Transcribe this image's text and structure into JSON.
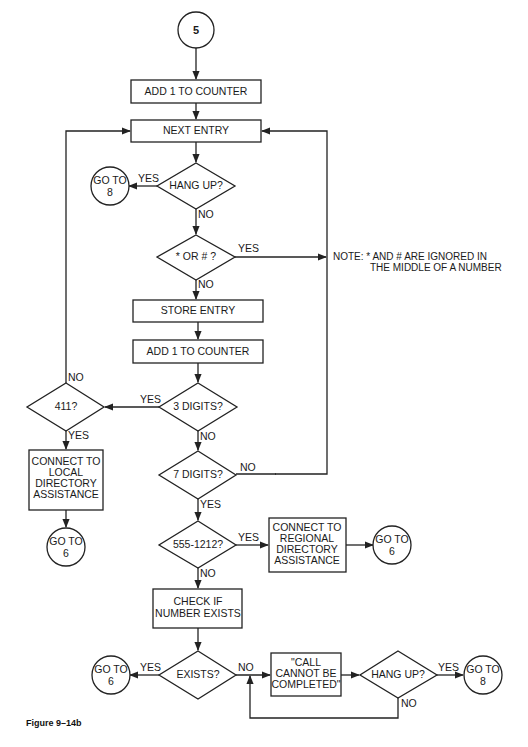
{
  "figure": {
    "caption": "Figure 9–14b",
    "start_connector": "5"
  },
  "nodes": {
    "add_counter_1": "ADD 1 TO COUNTER",
    "next_entry": "NEXT ENTRY",
    "hang_up_1": "HANG UP?",
    "goto_8_a": [
      "GO TO",
      "8"
    ],
    "star_or_hash": "* OR # ?",
    "note": [
      "NOTE:  *  AND  #  ARE IGNORED IN",
      "THE MIDDLE OF A NUMBER"
    ],
    "store_entry": "STORE ENTRY",
    "add_counter_2": "ADD 1 TO COUNTER",
    "three_digits": "3 DIGITS?",
    "is_411": "411?",
    "connect_local": [
      "CONNECT TO",
      "LOCAL",
      "DIRECTORY",
      "ASSISTANCE"
    ],
    "goto_6_a": [
      "GO TO",
      "6"
    ],
    "seven_digits": "7 DIGITS?",
    "is_5551212": "555-1212?",
    "connect_regional": [
      "CONNECT TO",
      "REGIONAL",
      "DIRECTORY",
      "ASSISTANCE"
    ],
    "goto_6_b": [
      "GO TO",
      "6"
    ],
    "check_exists": [
      "CHECK IF",
      "NUMBER EXISTS"
    ],
    "exists": "EXISTS?",
    "goto_6_c": [
      "GO TO",
      "6"
    ],
    "cannot_complete": [
      "\"CALL",
      "CANNOT BE",
      "COMPLETED\""
    ],
    "hang_up_2": "HANG UP?",
    "goto_8_b": [
      "GO TO",
      "8"
    ]
  },
  "labels": {
    "yes": "YES",
    "no": "NO"
  }
}
